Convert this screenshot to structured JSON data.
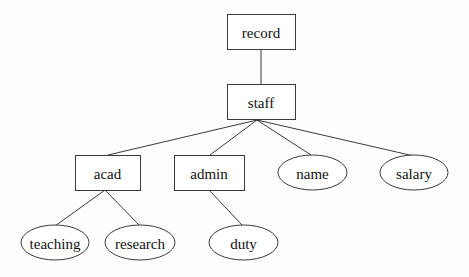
{
  "diagram": {
    "type": "tree",
    "colors": {
      "stroke": "#3a3a3a",
      "text": "#111111",
      "background": "#fdfdfd",
      "fill": "#ffffff"
    },
    "nodes": [
      {
        "id": "record",
        "label": "record",
        "shape": "rect",
        "x": 227,
        "y": 14,
        "w": 68,
        "h": 35
      },
      {
        "id": "staff",
        "label": "staff",
        "shape": "rect",
        "x": 227,
        "y": 84,
        "w": 68,
        "h": 35
      },
      {
        "id": "acad",
        "label": "acad",
        "shape": "rect",
        "x": 75,
        "y": 155,
        "w": 65,
        "h": 35
      },
      {
        "id": "admin",
        "label": "admin",
        "shape": "rect",
        "x": 174,
        "y": 155,
        "w": 70,
        "h": 35
      },
      {
        "id": "name",
        "label": "name",
        "shape": "ellipse",
        "x": 278,
        "y": 155,
        "w": 69,
        "h": 35
      },
      {
        "id": "salary",
        "label": "salary",
        "shape": "ellipse",
        "x": 380,
        "y": 155,
        "w": 68,
        "h": 35
      },
      {
        "id": "teaching",
        "label": "teaching",
        "shape": "ellipse",
        "x": 21,
        "y": 225,
        "w": 68,
        "h": 35
      },
      {
        "id": "research",
        "label": "research",
        "shape": "ellipse",
        "x": 105,
        "y": 225,
        "w": 70,
        "h": 35
      },
      {
        "id": "duty",
        "label": "duty",
        "shape": "ellipse",
        "x": 209,
        "y": 225,
        "w": 69,
        "h": 35
      }
    ],
    "edges": [
      {
        "from": "record",
        "to": "staff",
        "x1": 261,
        "y1": 49,
        "x2": 261,
        "y2": 84
      },
      {
        "from": "staff",
        "to": "acad",
        "x1": 257,
        "y1": 120,
        "x2": 108,
        "y2": 155
      },
      {
        "from": "staff",
        "to": "admin",
        "x1": 257,
        "y1": 120,
        "x2": 210,
        "y2": 155
      },
      {
        "from": "staff",
        "to": "name",
        "x1": 257,
        "y1": 120,
        "x2": 311,
        "y2": 155
      },
      {
        "from": "staff",
        "to": "salary",
        "x1": 257,
        "y1": 120,
        "x2": 414,
        "y2": 156
      },
      {
        "from": "acad",
        "to": "teaching",
        "x1": 105,
        "y1": 190,
        "x2": 55,
        "y2": 226
      },
      {
        "from": "acad",
        "to": "research",
        "x1": 105,
        "y1": 190,
        "x2": 140,
        "y2": 226
      },
      {
        "from": "admin",
        "to": "duty",
        "x1": 209,
        "y1": 190,
        "x2": 243,
        "y2": 226
      }
    ]
  }
}
